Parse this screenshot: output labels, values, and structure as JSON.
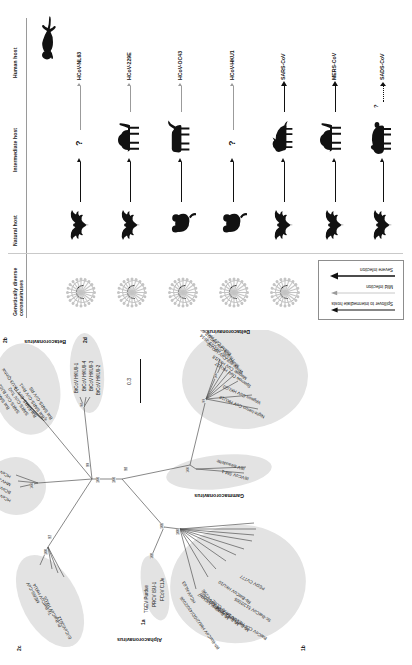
{
  "figure": {
    "panel_b_label": "b",
    "panel_a_label": "a"
  },
  "panel_hosts": {
    "columns": [
      {
        "id": "col-virus",
        "label": "Genetically diverse\ncoronaviruses"
      },
      {
        "id": "col-natural",
        "label": "Natural host"
      },
      {
        "id": "col-intermediate",
        "label": "Intermediate host"
      },
      {
        "id": "col-human",
        "label": "Human host"
      }
    ],
    "column_labels": {
      "virus_line1": "Genetically diverse",
      "virus_line2": "coronaviruses",
      "natural": "Natural host",
      "intermediate": "Intermediate host",
      "human": "Human host"
    },
    "rows": [
      {
        "virus": "HCoV-NL63",
        "natural_host": "bat",
        "intermediate_host": "unknown",
        "intermediate_symbol": "?",
        "severity": "mild"
      },
      {
        "virus": "HCoV-229E",
        "natural_host": "bat",
        "intermediate_host": "camel",
        "intermediate_symbol": "",
        "severity": "mild"
      },
      {
        "virus": "HCoV-OC43",
        "natural_host": "mouse",
        "intermediate_host": "cattle",
        "intermediate_symbol": "",
        "severity": "mild"
      },
      {
        "virus": "HCoV-HKU1",
        "natural_host": "mouse",
        "intermediate_host": "unknown",
        "intermediate_symbol": "?",
        "severity": "mild"
      },
      {
        "virus": "SARS-CoV",
        "natural_host": "bat",
        "intermediate_host": "civet",
        "intermediate_symbol": "",
        "severity": "severe"
      },
      {
        "virus": "MERS-CoV",
        "natural_host": "bat",
        "intermediate_host": "camel",
        "intermediate_symbol": "",
        "severity": "severe"
      },
      {
        "virus": "SADS-CoV",
        "natural_host": "bat",
        "intermediate_host": "pig",
        "intermediate_symbol": "",
        "severity": "severe",
        "human_uncertain": "?"
      }
    ],
    "human_icon": "human-silhouette-icon",
    "legend": {
      "items": [
        {
          "id": "spillover",
          "label": "Spillover to intermediate hosts",
          "style": "solid-dark"
        },
        {
          "id": "mild-infection",
          "label": "Mild infection",
          "style": "thin-grey"
        },
        {
          "id": "severe-infection",
          "label": "Severe infection",
          "style": "thick-dark"
        }
      ]
    }
  },
  "panel_tree": {
    "scale_bar_label": "0.3",
    "genera": [
      {
        "id": "alpha",
        "label": "Alphacoronavirus"
      },
      {
        "id": "beta",
        "label": "Betacoronavirus"
      },
      {
        "id": "gamma",
        "label": "Gammacoronavirus"
      },
      {
        "id": "delta",
        "label": "Deltacoronavirus"
      }
    ],
    "clades": [
      {
        "id": "1a",
        "label": "1a"
      },
      {
        "id": "1b",
        "label": "1b"
      },
      {
        "id": "2a",
        "label": "2a"
      },
      {
        "id": "2b",
        "label": "2b"
      },
      {
        "id": "2c",
        "label": "2c"
      },
      {
        "id": "2d",
        "label": "2d"
      }
    ],
    "taxa": {
      "clade_1a": [
        "TGEV Purdue",
        "PRCV ISU-1",
        "FCoV C1Je"
      ],
      "clade_1b": [
        "HCoV-NL63",
        "Rh-BatCoV HKU2/GD/430/2006",
        "HCoV-229E",
        "Mi-BatCoV A/CHN7",
        "Mi-BatCoV 1B-AFCD307",
        "Mi-BatCoV 1A-AFCD62",
        "Rs-BatCoV HKU10",
        "BatCoV CDPHE15/USA/2006",
        "Sc-BatCoV 512/2005",
        "PEDV CV777"
      ],
      "clade_2a": [
        "HCoV-OC43",
        "BCoV-WD5",
        "MHV-A59",
        "HCoV-HKU1"
      ],
      "clade_2b": [
        "Bat SARS-CoV WIV1",
        "SARS-CoV BJ01",
        "SARS-CoV Tor2",
        "Bat SARS-CoV HKU3-Qinhai",
        "Bat SARS-CoV Rm1",
        "Bat SARS-CoV RS"
      ],
      "clade_2c": [
        "MERS-CoV",
        "Ty-BatCoV HKU4",
        "Pi-BatCoV HKU5",
        "EriCoV/2012"
      ],
      "clade_2d": [
        "BtCoV HKU9-1",
        "BtCoV HKU9-4",
        "BtCoV HKU9-3",
        "BtCoV HKU9-2"
      ],
      "gamma": [
        "IBVCoV SM-1",
        "IBV Beaudette"
      ],
      "delta": [
        "Night-heron CoV HKU19",
        "Wigeon CoV HKU20",
        "Sparrow CoV HKU17",
        "Magpie CoV HKU18",
        "White-eye CoV HKU16",
        "Munia CoV HKU13-3514",
        "Thrush CoV HKU12-600",
        "Bulbul CoV HKU11-934"
      ]
    },
    "bootstrap_values": [
      "100",
      "100",
      "99",
      "98",
      "100",
      "100",
      "97",
      "100",
      "99",
      "100",
      "100",
      "96",
      "98",
      "100",
      "100"
    ]
  }
}
